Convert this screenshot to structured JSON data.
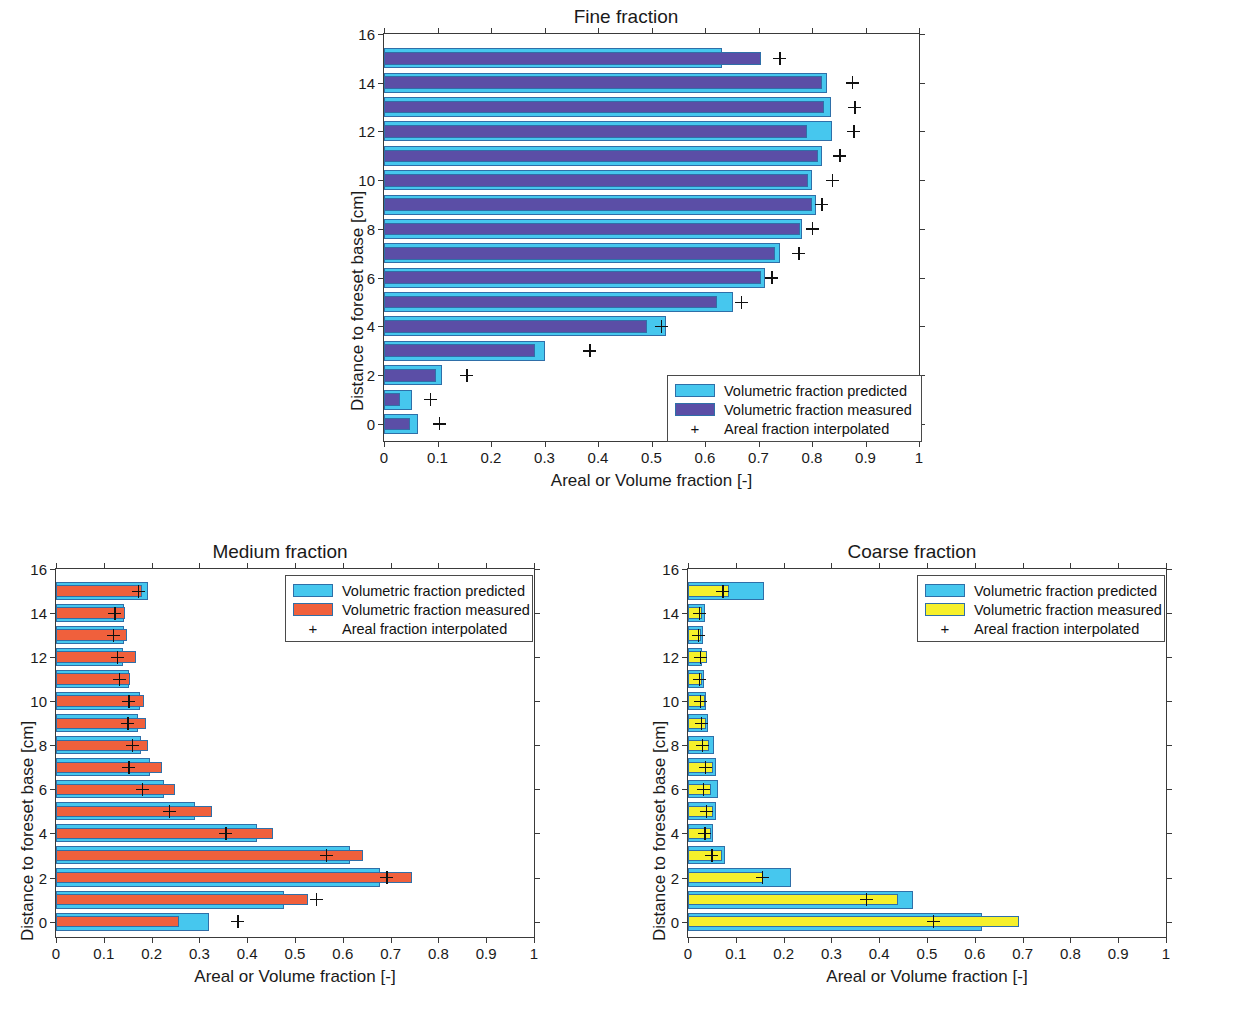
{
  "figure": {
    "shared_xlabel": "Areal or Volume fraction [-]",
    "shared_ylabel": "Distance to foreset base [cm]",
    "xticklabels": [
      "0",
      "0.1",
      "0.2",
      "0.3",
      "0.4",
      "0.5",
      "0.6",
      "0.7",
      "0.8",
      "0.9",
      "1"
    ],
    "yticklabels": [
      "0",
      "2",
      "4",
      "6",
      "8",
      "10",
      "12",
      "14",
      "16"
    ],
    "legend": {
      "predicted": "Volumetric fraction predicted",
      "measured": "Volumetric fraction measured",
      "interpolated": "Areal fraction interpolated"
    }
  },
  "colors": {
    "predicted": "#46C7EE",
    "measured_fine": "#5B4EA6",
    "measured_medium": "#F0603C",
    "measured_coarse": "#F6F02B",
    "bar_edge": "#2F6FA8",
    "axis": "#3A3A3A",
    "text": "#1A1A1A"
  },
  "chart_data": [
    {
      "id": "fine",
      "type": "bar",
      "orientation": "horizontal",
      "title": "Fine fraction",
      "xlabel": "Areal or Volume fraction [-]",
      "ylabel": "Distance to foreset base [cm]",
      "xlim": [
        0,
        1
      ],
      "ylim": [
        -0.7,
        16
      ],
      "xticks": [
        0,
        0.1,
        0.2,
        0.3,
        0.4,
        0.5,
        0.6,
        0.7,
        0.8,
        0.9,
        1
      ],
      "yticks": [
        0,
        2,
        4,
        6,
        8,
        10,
        12,
        14,
        16
      ],
      "grid": false,
      "legend_position": "bottom-right",
      "categories": [
        0,
        1,
        2,
        3,
        4,
        5,
        6,
        7,
        8,
        9,
        10,
        11,
        12,
        13,
        14,
        15
      ],
      "series": [
        {
          "name": "Volumetric fraction predicted",
          "color": "#46C7EE",
          "values": [
            0.063,
            0.052,
            0.108,
            0.3,
            0.528,
            0.652,
            0.713,
            0.74,
            0.782,
            0.808,
            0.8,
            0.818,
            0.838,
            0.835,
            0.828,
            0.632
          ]
        },
        {
          "name": "Volumetric fraction measured",
          "color": "#5B4EA6",
          "values": [
            0.048,
            0.03,
            0.098,
            0.282,
            0.492,
            0.622,
            0.705,
            0.73,
            0.778,
            0.8,
            0.792,
            0.812,
            0.79,
            0.822,
            0.818,
            0.705
          ]
        },
        {
          "name": "Areal fraction interpolated",
          "marker": "+",
          "color": "#111111",
          "values": [
            0.103,
            0.086,
            0.155,
            0.385,
            0.518,
            0.668,
            0.725,
            0.775,
            0.8,
            0.818,
            0.838,
            0.852,
            0.878,
            0.88,
            0.875,
            0.74
          ]
        }
      ]
    },
    {
      "id": "medium",
      "type": "bar",
      "orientation": "horizontal",
      "title": "Medium fraction",
      "xlabel": "Areal or Volume fraction [-]",
      "ylabel": "Distance to foreset base [cm]",
      "xlim": [
        0,
        1
      ],
      "ylim": [
        -0.7,
        16
      ],
      "xticks": [
        0,
        0.1,
        0.2,
        0.3,
        0.4,
        0.5,
        0.6,
        0.7,
        0.8,
        0.9,
        1
      ],
      "yticks": [
        0,
        2,
        4,
        6,
        8,
        10,
        12,
        14,
        16
      ],
      "grid": false,
      "legend_position": "top-right",
      "categories": [
        0,
        1,
        2,
        3,
        4,
        5,
        6,
        7,
        8,
        9,
        10,
        11,
        12,
        13,
        14,
        15
      ],
      "series": [
        {
          "name": "Volumetric fraction predicted",
          "color": "#46C7EE",
          "values": [
            0.32,
            0.477,
            0.678,
            0.615,
            0.42,
            0.29,
            0.225,
            0.196,
            0.178,
            0.172,
            0.175,
            0.152,
            0.14,
            0.143,
            0.142,
            0.192
          ]
        },
        {
          "name": "Volumetric fraction measured",
          "color": "#F0603C",
          "values": [
            0.258,
            0.528,
            0.745,
            0.643,
            0.453,
            0.327,
            0.248,
            0.222,
            0.192,
            0.188,
            0.185,
            0.155,
            0.168,
            0.148,
            0.145,
            0.18
          ]
        },
        {
          "name": "Areal fraction interpolated",
          "marker": "+",
          "color": "#111111",
          "values": [
            0.38,
            0.545,
            0.692,
            0.565,
            0.355,
            0.237,
            0.18,
            0.152,
            0.16,
            0.15,
            0.152,
            0.132,
            0.128,
            0.12,
            0.123,
            0.172
          ]
        }
      ]
    },
    {
      "id": "coarse",
      "type": "bar",
      "orientation": "horizontal",
      "title": "Coarse fraction",
      "xlabel": "Areal or Volume fraction [-]",
      "ylabel": "Distance to foreset base [cm]",
      "xlim": [
        0,
        1
      ],
      "ylim": [
        -0.7,
        16
      ],
      "xticks": [
        0,
        0.1,
        0.2,
        0.3,
        0.4,
        0.5,
        0.6,
        0.7,
        0.8,
        0.9,
        1
      ],
      "yticks": [
        0,
        2,
        4,
        6,
        8,
        10,
        12,
        14,
        16
      ],
      "grid": false,
      "legend_position": "top-right",
      "categories": [
        0,
        1,
        2,
        3,
        4,
        5,
        6,
        7,
        8,
        9,
        10,
        11,
        12,
        13,
        14,
        15
      ],
      "series": [
        {
          "name": "Volumetric fraction predicted",
          "color": "#46C7EE",
          "values": [
            0.615,
            0.47,
            0.215,
            0.078,
            0.052,
            0.058,
            0.062,
            0.058,
            0.055,
            0.042,
            0.038,
            0.033,
            0.03,
            0.032,
            0.035,
            0.16
          ]
        },
        {
          "name": "Volumetric fraction measured",
          "color": "#F6F02B",
          "values": [
            0.692,
            0.44,
            0.157,
            0.072,
            0.048,
            0.052,
            0.048,
            0.052,
            0.043,
            0.038,
            0.035,
            0.03,
            0.04,
            0.028,
            0.03,
            0.085
          ]
        },
        {
          "name": "Areal fraction interpolated",
          "marker": "+",
          "color": "#111111",
          "values": [
            0.513,
            0.373,
            0.155,
            0.05,
            0.035,
            0.038,
            0.032,
            0.036,
            0.03,
            0.028,
            0.026,
            0.024,
            0.026,
            0.022,
            0.024,
            0.073
          ]
        }
      ]
    }
  ]
}
